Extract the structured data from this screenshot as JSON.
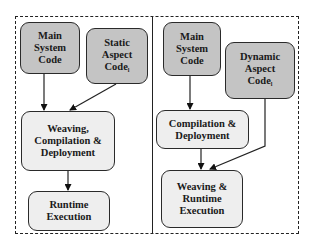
{
  "diagram": {
    "left_panel": {
      "main_code": {
        "line1": "Main",
        "line2": "System",
        "line3": "Code"
      },
      "aspect_code": {
        "line1": "Static",
        "line2": "Aspect",
        "line3": "Code",
        "subscript": "l"
      },
      "build": {
        "line1": "Weaving,",
        "line2": "Compilation &",
        "line3": "Deployment"
      },
      "run": {
        "line1": "Runtime",
        "line2": "Execution"
      }
    },
    "right_panel": {
      "main_code": {
        "line1": "Main",
        "line2": "System",
        "line3": "Code"
      },
      "aspect_code": {
        "line1": "Dynamic",
        "line2": "Aspect",
        "line3": "Code",
        "subscript": "l"
      },
      "build": {
        "line1": "Compilation &",
        "line2": "Deployment"
      },
      "run": {
        "line1": "Weaving &",
        "line2": "Runtime",
        "line3": "Execution"
      }
    },
    "edges": [
      {
        "from": "left.main_code",
        "to": "left.build"
      },
      {
        "from": "left.aspect_code",
        "to": "left.build"
      },
      {
        "from": "left.build",
        "to": "left.run"
      },
      {
        "from": "right.main_code",
        "to": "right.build"
      },
      {
        "from": "right.build",
        "to": "right.run"
      },
      {
        "from": "right.aspect_code",
        "to": "right.run"
      }
    ],
    "colors": {
      "source_box": "#c4c4c4",
      "process_box": "#eeeeee",
      "stroke": "#222222"
    }
  }
}
